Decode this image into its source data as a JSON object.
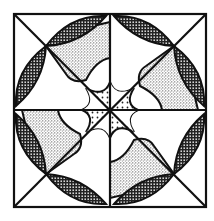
{
  "figure": {
    "colors": {
      "background": "#ffffff",
      "ink": "#111111",
      "stipple": "#555555",
      "lens_fill": "#333333"
    },
    "square": {
      "x": 14,
      "y": 14,
      "size": 192
    },
    "center": {
      "x": 110,
      "y": 110
    },
    "patterns": [
      "lens-crosshatch",
      "wedge-stipple",
      "star-dots"
    ]
  }
}
